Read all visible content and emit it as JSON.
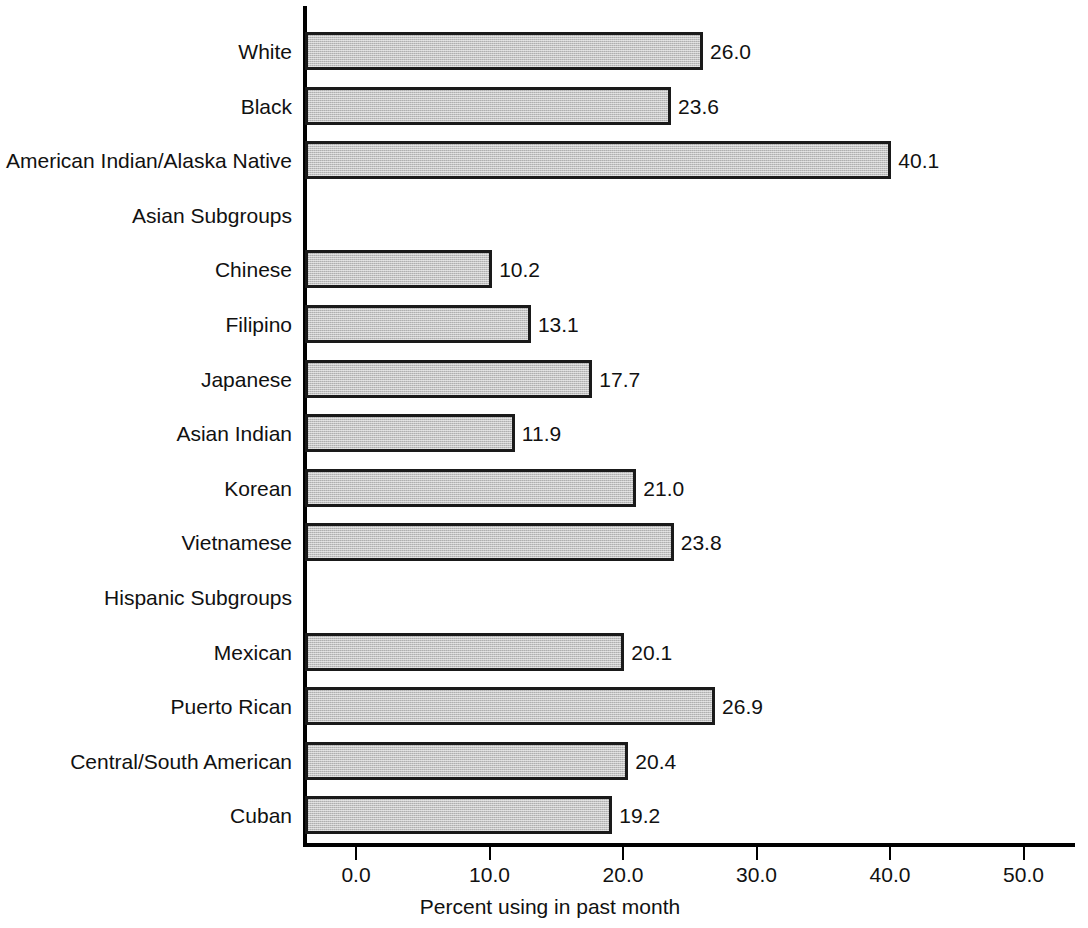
{
  "chart_data": {
    "type": "bar",
    "orientation": "horizontal",
    "title": "",
    "xlabel": "Percent using in past month",
    "ylabel": "",
    "xlim": [
      0.0,
      50.0
    ],
    "xticks": [
      "0.0",
      "10.0",
      "20.0",
      "30.0",
      "40.0",
      "50.0"
    ],
    "xtick_values": [
      0.0,
      10.0,
      20.0,
      30.0,
      40.0,
      50.0
    ],
    "grid": false,
    "legend": null,
    "categories": [
      "White",
      "Black",
      "American Indian/Alaska Native",
      "Asian Subgroups",
      "Chinese",
      "Filipino",
      "Japanese",
      "Asian Indian",
      "Korean",
      "Vietnamese",
      "Hispanic Subgroups",
      "Mexican",
      "Puerto Rican",
      "Central/South American",
      "Cuban"
    ],
    "values": [
      26.0,
      23.6,
      40.1,
      null,
      10.2,
      13.1,
      17.7,
      11.9,
      21.0,
      23.8,
      null,
      20.1,
      26.9,
      20.4,
      19.2
    ],
    "value_labels": [
      "26.0",
      "23.6",
      "40.1",
      "",
      "10.2",
      "13.1",
      "17.7",
      "11.9",
      "21.0",
      "23.8",
      "",
      "20.1",
      "26.9",
      "20.4",
      "19.2"
    ],
    "header_rows": [
      "Asian Subgroups",
      "Hispanic Subgroups"
    ],
    "bar_fill_color": "#c3c3c3",
    "bar_edge_color": "#1a1a1a",
    "background_color": "#ffffff",
    "text_color": "#111111"
  },
  "rows": [
    {
      "label": "White",
      "value": 26.0,
      "value_label": "26.0",
      "is_header": false
    },
    {
      "label": "Black",
      "value": 23.6,
      "value_label": "23.6",
      "is_header": false
    },
    {
      "label": "American Indian/Alaska Native",
      "value": 40.1,
      "value_label": "40.1",
      "is_header": false
    },
    {
      "label": "Asian Subgroups",
      "value": null,
      "value_label": "",
      "is_header": true
    },
    {
      "label": "Chinese",
      "value": 10.2,
      "value_label": "10.2",
      "is_header": false
    },
    {
      "label": "Filipino",
      "value": 13.1,
      "value_label": "13.1",
      "is_header": false
    },
    {
      "label": "Japanese",
      "value": 17.7,
      "value_label": "17.7",
      "is_header": false
    },
    {
      "label": "Asian Indian",
      "value": 11.9,
      "value_label": "11.9",
      "is_header": false
    },
    {
      "label": "Korean",
      "value": 21.0,
      "value_label": "21.0",
      "is_header": false
    },
    {
      "label": "Vietnamese",
      "value": 23.8,
      "value_label": "23.8",
      "is_header": false
    },
    {
      "label": "Hispanic Subgroups",
      "value": null,
      "value_label": "",
      "is_header": true
    },
    {
      "label": "Mexican",
      "value": 20.1,
      "value_label": "20.1",
      "is_header": false
    },
    {
      "label": "Puerto Rican",
      "value": 26.9,
      "value_label": "26.9",
      "is_header": false
    },
    {
      "label": "Central/South American",
      "value": 20.4,
      "value_label": "20.4",
      "is_header": false
    },
    {
      "label": "Cuban",
      "value": 19.2,
      "value_label": "19.2",
      "is_header": false
    }
  ],
  "axis": {
    "x_title": "Percent using in past month",
    "ticks": [
      "0.0",
      "10.0",
      "20.0",
      "30.0",
      "40.0",
      "50.0"
    ]
  }
}
